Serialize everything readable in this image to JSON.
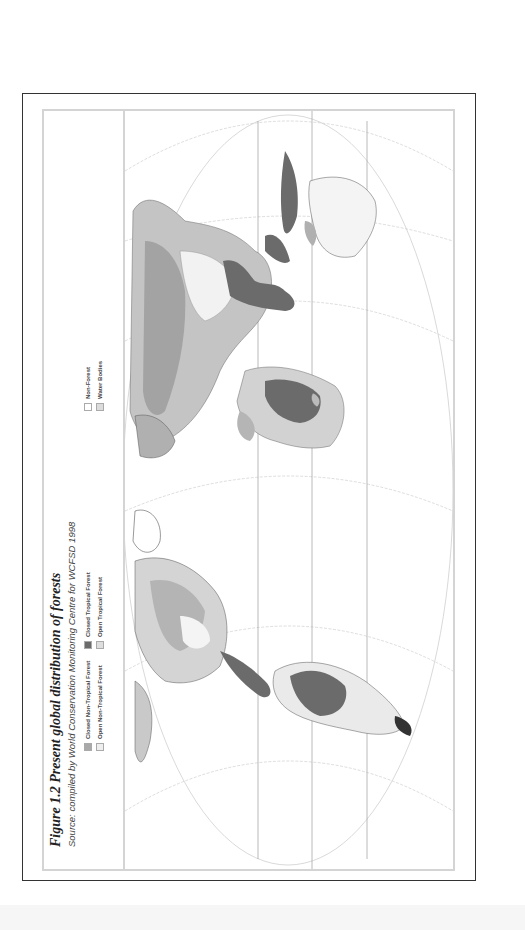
{
  "figure": {
    "title": "Figure 1.2  Present global distribution of forests",
    "source": "Source: compiled by World Conservation Monitoring Centre for WCFSD 1998",
    "orientation": "rotated 90° counter-clockwise"
  },
  "legend": {
    "items": [
      {
        "label": "Closed Non-Tropical Forest",
        "color": "#a9a9a9"
      },
      {
        "label": "Open Non-Tropical Forest",
        "color": "#e6e6e6"
      },
      {
        "label": "Closed Tropical Forest",
        "color": "#6b6b6b"
      },
      {
        "label": "Open Tropical Forest",
        "color": "#d9d9d9"
      },
      {
        "label": "Non-Forest",
        "color": "#ffffff"
      },
      {
        "label": "Water Bodies",
        "color": "#dcdcdc"
      }
    ]
  },
  "map": {
    "projection": "world map, elliptical projection, graticule shown",
    "colors": {
      "closed_tropical": "#6b6b6b",
      "closed_non_tropical": "#a9a9a9",
      "open": "#d8d8d8",
      "outline": "#555555",
      "graticule": "#bdbdbd"
    }
  }
}
